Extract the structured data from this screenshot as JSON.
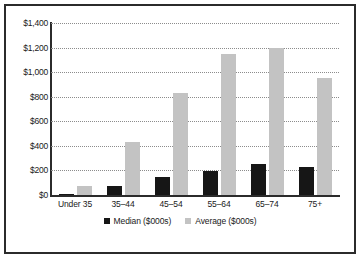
{
  "chart_data": {
    "type": "bar",
    "title": "",
    "subtitle": "",
    "xlabel": "",
    "ylabel": "",
    "categories": [
      "Under 35",
      "35–44",
      "45–54",
      "55–64",
      "65–74",
      "75+"
    ],
    "series": [
      {
        "name": "Median ($000s)",
        "color": "#161616",
        "values": [
          10,
          75,
          150,
          195,
          250,
          230
        ]
      },
      {
        "name": "Average ($000s)",
        "color": "#c3c3c3",
        "values": [
          75,
          430,
          830,
          1150,
          1195,
          950
        ]
      }
    ],
    "ylim": [
      0,
      1400
    ],
    "ytick_values": [
      0,
      200,
      400,
      600,
      800,
      1000,
      1200,
      1400
    ],
    "ytick_labels": [
      "$0",
      "$200",
      "$400",
      "$600",
      "$800",
      "$1,000",
      "$1,200",
      "$1,400"
    ],
    "grid": true,
    "grid_style": "dotted-horizontal",
    "legend_position": "bottom-center",
    "frame_color": "#2b2b2b",
    "background_color": "#ffffff"
  },
  "legend": {
    "entries": [
      {
        "label": "Median ($000s)"
      },
      {
        "label": "Average ($000s)"
      }
    ]
  }
}
